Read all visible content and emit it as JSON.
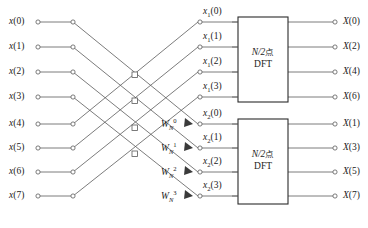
{
  "figure": {
    "caption_clipped": "按序号分解为偶数与奇数两组的图解",
    "type": "fft-butterfly-signal-flow-graph"
  },
  "inputs": {
    "label_base": "x",
    "items": [
      {
        "name": "x(0)",
        "index": 0,
        "y": 22
      },
      {
        "name": "x(1)",
        "index": 1,
        "y": 47
      },
      {
        "name": "x(2)",
        "index": 2,
        "y": 72
      },
      {
        "name": "x(3)",
        "index": 3,
        "y": 97
      },
      {
        "name": "x(4)",
        "index": 4,
        "y": 124
      },
      {
        "name": "x(5)",
        "index": 5,
        "y": 148
      },
      {
        "name": "x(6)",
        "index": 6,
        "y": 172
      },
      {
        "name": "x(7)",
        "index": 7,
        "y": 196
      }
    ]
  },
  "mid_top": {
    "label_base": "x1",
    "items": [
      "x1(0)",
      "x1(1)",
      "x1(2)",
      "x1(3)"
    ]
  },
  "mid_bottom": {
    "label_base": "x2",
    "items": [
      "x2(0)",
      "x2(1)",
      "x2(2)",
      "x2(3)"
    ]
  },
  "twiddles": [
    {
      "base": "W",
      "sub": "N",
      "sup": "0",
      "y": 132
    },
    {
      "base": "W",
      "sub": "N",
      "sup": "1",
      "y": 156
    },
    {
      "base": "W",
      "sub": "N",
      "sup": "2",
      "y": 180
    },
    {
      "base": "W",
      "sub": "N",
      "sup": "3",
      "y": 204
    }
  ],
  "blocks": [
    {
      "id": "dft-top",
      "line1": "N/2",
      "line1_cjk": "点",
      "line2": "DFT"
    },
    {
      "id": "dft-bottom",
      "line1": "N/2",
      "line1_cjk": "点",
      "line2": "DFT"
    }
  ],
  "outputs": {
    "label_base": "X",
    "items": [
      "X(0)",
      "X(2)",
      "X(4)",
      "X(6)",
      "X(1)",
      "X(3)",
      "X(5)",
      "X(7)"
    ]
  },
  "colors": {
    "line": "#5a5a5a",
    "node_stroke": "#5a5a5a",
    "node_fill": "#ffffff",
    "box_stroke": "#2b2b2b",
    "text": "#1d1d1d",
    "background": "#ffffff"
  }
}
